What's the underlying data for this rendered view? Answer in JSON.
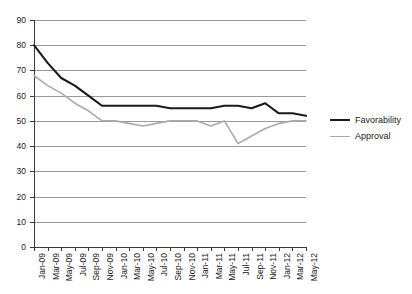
{
  "chart_data": {
    "type": "line",
    "title": "",
    "xlabel": "",
    "ylabel": "",
    "ylim": [
      0,
      90
    ],
    "ytick_step": 10,
    "grid": true,
    "legend_position": "right",
    "categories": [
      "Jan-09",
      "Mar-09",
      "May-09",
      "Jul-09",
      "Sep-09",
      "Nov-09",
      "Jan-10",
      "Mar-10",
      "May-10",
      "Jul-10",
      "Sep-10",
      "Nov-10",
      "Jan-11",
      "Mar-11",
      "May-11",
      "Jul-11",
      "Sep-11",
      "Nov-11",
      "Jan-12",
      "Mar-12",
      "May-12"
    ],
    "yticks": [
      "0",
      "10",
      "20",
      "30",
      "40",
      "50",
      "60",
      "70",
      "80",
      "90"
    ],
    "series": [
      {
        "name": "Favorability",
        "color": "#1a1a1a",
        "values": [
          80,
          73,
          67,
          64,
          60,
          56,
          56,
          56,
          56,
          56,
          55,
          55,
          55,
          55,
          56,
          56,
          55,
          57,
          53,
          53,
          52
        ]
      },
      {
        "name": "Approval",
        "color": "#aaaaaa",
        "values": [
          68,
          64,
          61,
          57,
          54,
          50,
          50,
          49,
          48,
          49,
          50,
          50,
          50,
          48,
          50,
          41,
          44,
          47,
          49,
          50,
          50
        ]
      }
    ]
  },
  "legend": {
    "items": [
      {
        "label": "Favorability",
        "color": "#1a1a1a"
      },
      {
        "label": "Approval",
        "color": "#aaaaaa"
      }
    ]
  }
}
